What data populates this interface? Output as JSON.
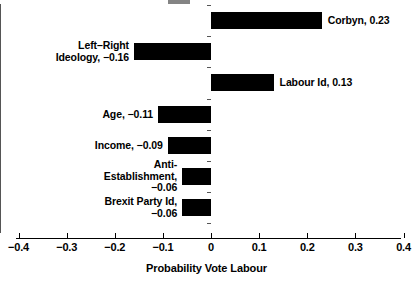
{
  "chart_data": {
    "type": "bar",
    "orientation": "horizontal",
    "title": "",
    "xlabel": "Probability Vote Labour",
    "ylabel": "",
    "xlim": [
      -0.4,
      0.4
    ],
    "xticks": [
      "−0.4",
      "−0.3",
      "−0.2",
      "−0.1",
      "0",
      "0.1",
      "0.2",
      "0.3",
      "0.4"
    ],
    "xtick_values": [
      -0.4,
      -0.3,
      -0.2,
      -0.1,
      0,
      0.1,
      0.2,
      0.3,
      0.4
    ],
    "grid": false,
    "legend": null,
    "categories": [
      "Corbyn",
      "Left–Right Ideology",
      "Labour Id",
      "Age",
      "Income",
      "Anti-Establishment",
      "Brexit Party Id"
    ],
    "values": [
      0.23,
      -0.16,
      0.13,
      -0.11,
      -0.09,
      -0.06,
      -0.06
    ],
    "bars": [
      {
        "category": "Corbyn",
        "value": 0.23,
        "label": "Corbyn, 0.23",
        "label_lines": [
          "Corbyn, 0.23"
        ],
        "label_side": "right"
      },
      {
        "category": "Left–Right Ideology",
        "value": -0.16,
        "label": "Left–Right Ideology, −0.16",
        "label_lines": [
          "Left–Right",
          "Ideology, −0.16"
        ],
        "label_side": "left"
      },
      {
        "category": "Labour Id",
        "value": 0.13,
        "label": "Labour Id, 0.13",
        "label_lines": [
          "Labour Id, 0.13"
        ],
        "label_side": "right"
      },
      {
        "category": "Age",
        "value": -0.11,
        "label": "Age, −0.11",
        "label_lines": [
          "Age, −0.11"
        ],
        "label_side": "left"
      },
      {
        "category": "Income",
        "value": -0.09,
        "label": "Income, −0.09",
        "label_lines": [
          "Income, −0.09"
        ],
        "label_side": "left"
      },
      {
        "category": "Anti-Establishment",
        "value": -0.06,
        "label": "Anti-Establishment, −0.06",
        "label_lines": [
          "Anti-",
          "Establishment,",
          "−0.06"
        ],
        "label_side": "left"
      },
      {
        "category": "Brexit Party Id",
        "value": -0.06,
        "label": "Brexit Party Id, −0.06",
        "label_lines": [
          "Brexit Party Id,",
          "−0.06"
        ],
        "label_side": "left"
      }
    ],
    "colors": {
      "bar": "#000000",
      "axis": "#000000",
      "zero_axis": "#555555",
      "background": "#ffffff",
      "text": "#000000"
    }
  }
}
